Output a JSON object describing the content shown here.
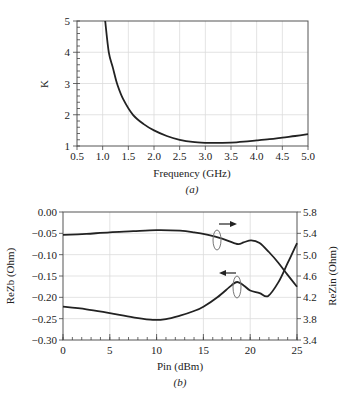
{
  "chart_data": [
    {
      "type": "line",
      "title": "",
      "caption": "(a)",
      "xlabel": "Frequency (GHz)",
      "ylabel": "K",
      "xlim": [
        0.5,
        5.0
      ],
      "ylim": [
        1,
        5
      ],
      "grid": true,
      "xticks": [
        "0.5",
        "1.0",
        "1.5",
        "2.0",
        "2.5",
        "3.0",
        "3.5",
        "4.0",
        "4.5",
        "5.0"
      ],
      "yticks": [
        "1",
        "2",
        "3",
        "4",
        "5"
      ],
      "series": [
        {
          "name": "K",
          "x": [
            1.05,
            1.12,
            1.2,
            1.28,
            1.4,
            1.59,
            1.8,
            2.0,
            2.25,
            2.5,
            2.75,
            3.0,
            3.25,
            3.5,
            3.75,
            4.0,
            4.25,
            4.5,
            4.75,
            5.0
          ],
          "y": [
            5.0,
            4.0,
            3.5,
            3.0,
            2.5,
            2.0,
            1.7,
            1.5,
            1.32,
            1.2,
            1.13,
            1.1,
            1.1,
            1.11,
            1.14,
            1.18,
            1.22,
            1.27,
            1.32,
            1.38
          ]
        }
      ]
    },
    {
      "type": "line",
      "title": "",
      "caption": "(b)",
      "xlabel": "Pin (dBm)",
      "ylabel": "ReZb (Ohm)",
      "ylabel_right": "ReZin (Ohm)",
      "xlim": [
        0,
        25
      ],
      "ylim": [
        -0.3,
        0.0
      ],
      "ylim_right": [
        3.4,
        5.8
      ],
      "grid": true,
      "xticks": [
        "0",
        "5",
        "10",
        "15",
        "20",
        "25"
      ],
      "yticks": [
        "0.00",
        "-0.05",
        "-0.10",
        "-0.15",
        "-0.20",
        "-0.25",
        "-0.30"
      ],
      "yticks_right": [
        "5.8",
        "5.4",
        "5.0",
        "4.6",
        "4.2",
        "3.8",
        "3.4"
      ],
      "series": [
        {
          "name": "ReZin",
          "axis": "right",
          "x": [
            0,
            2.5,
            5,
            7.5,
            10,
            12.5,
            14,
            15.5,
            17,
            18.6,
            19.3,
            20.1,
            21,
            22,
            23,
            24,
            25
          ],
          "y": [
            5.37,
            5.39,
            5.42,
            5.44,
            5.46,
            5.45,
            5.42,
            5.37,
            5.3,
            5.2,
            5.23,
            5.27,
            5.22,
            5.05,
            4.85,
            4.62,
            4.4
          ]
        },
        {
          "name": "ReZb",
          "axis": "left",
          "x": [
            0,
            2.5,
            5,
            7.5,
            9.6,
            11,
            12.5,
            14,
            15,
            16.5,
            18,
            18.6,
            19.3,
            20,
            21,
            21.9,
            23,
            24,
            25
          ],
          "y": [
            -0.222,
            -0.228,
            -0.237,
            -0.247,
            -0.253,
            -0.251,
            -0.243,
            -0.232,
            -0.222,
            -0.2,
            -0.172,
            -0.164,
            -0.172,
            -0.184,
            -0.19,
            -0.197,
            -0.165,
            -0.12,
            -0.073
          ]
        }
      ],
      "annotations": [
        {
          "target": "ReZin",
          "arrow_direction": "right",
          "meaning": "right axis"
        },
        {
          "target": "ReZb",
          "arrow_direction": "left",
          "meaning": "left axis"
        }
      ]
    }
  ]
}
